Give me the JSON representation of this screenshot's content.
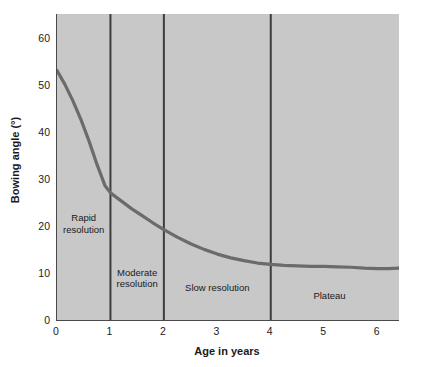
{
  "chart_data": {
    "type": "line",
    "title": "",
    "xlabel": "Age in years",
    "ylabel": "Bowing angle (°)",
    "xlim": [
      0,
      6.4
    ],
    "ylim": [
      0,
      65
    ],
    "xticks": [
      0,
      1,
      2,
      3,
      4,
      5,
      6
    ],
    "xtick_labels": [
      "0",
      "1",
      "2",
      "3",
      "4",
      "5",
      "6"
    ],
    "yticks": [
      0,
      10,
      20,
      30,
      40,
      50,
      60
    ],
    "ytick_labels": [
      "0",
      "10",
      "20",
      "30",
      "40",
      "50",
      "60"
    ],
    "grid": false,
    "legend": null,
    "plot_background": "#c8c8c8",
    "line_color": "#6b6b6b",
    "axis_color": "#4a4a4a",
    "divider_color": "#3d3d3d",
    "series": [
      {
        "name": "Bowing angle",
        "x": [
          0.0,
          0.15,
          0.3,
          0.45,
          0.6,
          0.75,
          0.9,
          1.0,
          1.2,
          1.4,
          1.6,
          1.8,
          2.0,
          2.25,
          2.5,
          2.75,
          3.0,
          3.25,
          3.5,
          3.75,
          4.0,
          4.25,
          4.5,
          4.75,
          5.0,
          5.25,
          5.5,
          5.75,
          6.0,
          6.2,
          6.4
        ],
        "y": [
          53.0,
          50.0,
          46.5,
          42.5,
          38.0,
          33.0,
          28.5,
          27.0,
          25.3,
          23.6,
          22.1,
          20.6,
          19.2,
          17.6,
          16.2,
          15.0,
          14.0,
          13.2,
          12.6,
          12.1,
          11.8,
          11.6,
          11.5,
          11.4,
          11.4,
          11.3,
          11.2,
          11.0,
          10.9,
          10.9,
          11.0
        ]
      }
    ],
    "dividers": [
      {
        "x": 1,
        "label": "year-1-divider"
      },
      {
        "x": 2,
        "label": "year-2-divider"
      },
      {
        "x": 4,
        "label": "year-4-divider"
      }
    ],
    "annotations": [
      {
        "name": "rapid-resolution",
        "text": "Rapid\nresolution",
        "x_center": 0.5,
        "y_center": 20.5
      },
      {
        "name": "moderate-resolution",
        "text": "Moderate\nresolution",
        "x_center": 1.5,
        "y_center": 9.0
      },
      {
        "name": "slow-resolution",
        "text": "Slow resolution",
        "x_center": 3.0,
        "y_center": 6.8
      },
      {
        "name": "plateau",
        "text": "Plateau",
        "x_center": 5.1,
        "y_center": 5.0
      }
    ]
  }
}
